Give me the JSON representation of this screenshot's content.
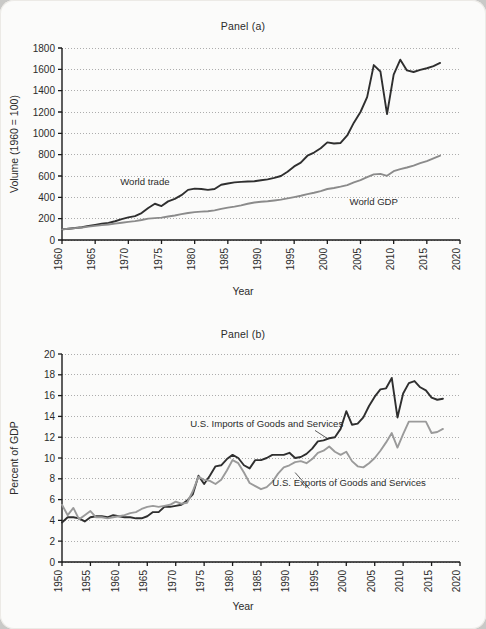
{
  "figure": {
    "background_color": "#fbfbfa",
    "page_color": "#c9c9c7",
    "axis_color": "#1a1a1a",
    "grid_color": "#9a9a9a"
  },
  "panels": [
    {
      "id": "panel-a",
      "title": "Panel (a)",
      "xlabel": "Year",
      "ylabel": "Volume (1960 = 100)",
      "series_colors": {
        "world_trade": "#2f2f2f",
        "world_gdp": "#8b8b8b"
      },
      "annotations": [
        {
          "text": "World trade",
          "x": 1972.5,
          "y": 520
        },
        {
          "text": "World GDP",
          "x": 2007.0,
          "y": 330
        }
      ]
    },
    {
      "id": "panel-b",
      "title": "Panel (b)",
      "xlabel": "Year",
      "ylabel": "Percent of GDP",
      "series_colors": {
        "imports": "#2f2f2f",
        "exports": "#9a9a9a"
      },
      "annotations": [
        {
          "text": "U.S. Imports of Goods and Services",
          "x": 1986.0,
          "y": 13.0
        },
        {
          "text": "U.S. Exports of Goods and Services",
          "x": 2000.5,
          "y": 7.3
        }
      ]
    }
  ],
  "chart_data": [
    {
      "type": "line",
      "title": "Panel (a)",
      "xlabel": "Year",
      "ylabel": "Volume (1960 = 100)",
      "xlim": [
        1960,
        2020
      ],
      "ylim": [
        0,
        1800
      ],
      "xticks": [
        1960,
        1965,
        1970,
        1975,
        1980,
        1985,
        1990,
        1995,
        2000,
        2005,
        2010,
        2015,
        2020
      ],
      "yticks": [
        0,
        200,
        400,
        600,
        800,
        1000,
        1200,
        1400,
        1600,
        1800
      ],
      "grid": "horizontal-dotted",
      "legend": "inline-annotations",
      "x": [
        1960,
        1961,
        1962,
        1963,
        1964,
        1965,
        1966,
        1967,
        1968,
        1969,
        1970,
        1971,
        1972,
        1973,
        1974,
        1975,
        1976,
        1977,
        1978,
        1979,
        1980,
        1981,
        1982,
        1983,
        1984,
        1985,
        1986,
        1987,
        1988,
        1989,
        1990,
        1991,
        1992,
        1993,
        1994,
        1995,
        1996,
        1997,
        1998,
        1999,
        2000,
        2001,
        2002,
        2003,
        2004,
        2005,
        2006,
        2007,
        2008,
        2009,
        2010,
        2011,
        2012,
        2013,
        2014,
        2015,
        2016,
        2017
      ],
      "series": [
        {
          "name": "World trade",
          "color": "#2f2f2f",
          "values": [
            100,
            106,
            112,
            120,
            132,
            142,
            153,
            160,
            176,
            196,
            212,
            224,
            252,
            300,
            340,
            318,
            362,
            385,
            420,
            470,
            482,
            478,
            470,
            478,
            518,
            530,
            540,
            545,
            549,
            551,
            560,
            568,
            582,
            600,
            640,
            690,
            725,
            790,
            820,
            860,
            915,
            905,
            910,
            980,
            1100,
            1200,
            1340,
            1640,
            1580,
            1180,
            1550,
            1690,
            1590,
            1575,
            1595,
            1610,
            1630,
            1660
          ]
        },
        {
          "name": "World GDP",
          "color": "#8b8b8b",
          "values": [
            100,
            105,
            111,
            117,
            125,
            132,
            139,
            145,
            153,
            162,
            170,
            177,
            187,
            200,
            205,
            210,
            220,
            230,
            242,
            253,
            261,
            266,
            270,
            278,
            292,
            303,
            313,
            325,
            340,
            352,
            358,
            363,
            370,
            378,
            390,
            402,
            415,
            430,
            443,
            458,
            478,
            488,
            500,
            515,
            540,
            562,
            590,
            615,
            620,
            602,
            645,
            665,
            680,
            698,
            720,
            740,
            765,
            790
          ]
        }
      ]
    },
    {
      "type": "line",
      "title": "Panel (b)",
      "xlabel": "Year",
      "ylabel": "Percent of GDP",
      "xlim": [
        1950,
        2020
      ],
      "ylim": [
        0,
        20
      ],
      "xticks": [
        1950,
        1955,
        1960,
        1965,
        1970,
        1975,
        1980,
        1985,
        1990,
        1995,
        2000,
        2005,
        2010,
        2015,
        2020
      ],
      "yticks": [
        0,
        2,
        4,
        6,
        8,
        10,
        12,
        14,
        16,
        18,
        20
      ],
      "grid": "horizontal-dotted",
      "legend": "inline-annotations",
      "x": [
        1950,
        1951,
        1952,
        1953,
        1954,
        1955,
        1956,
        1957,
        1958,
        1959,
        1960,
        1961,
        1962,
        1963,
        1964,
        1965,
        1966,
        1967,
        1968,
        1969,
        1970,
        1971,
        1972,
        1973,
        1974,
        1975,
        1976,
        1977,
        1978,
        1979,
        1980,
        1981,
        1982,
        1983,
        1984,
        1985,
        1986,
        1987,
        1988,
        1989,
        1990,
        1991,
        1992,
        1993,
        1994,
        1995,
        1996,
        1997,
        1998,
        1999,
        2000,
        2001,
        2002,
        2003,
        2004,
        2005,
        2006,
        2007,
        2008,
        2009,
        2010,
        2011,
        2012,
        2013,
        2014,
        2015,
        2016,
        2017
      ],
      "series": [
        {
          "name": "U.S. Imports of Goods and Services",
          "color": "#2f2f2f",
          "values": [
            3.8,
            4.3,
            4.3,
            4.2,
            3.9,
            4.3,
            4.4,
            4.4,
            4.3,
            4.5,
            4.4,
            4.3,
            4.3,
            4.2,
            4.2,
            4.4,
            4.8,
            4.8,
            5.3,
            5.3,
            5.4,
            5.5,
            5.9,
            6.5,
            8.3,
            7.5,
            8.3,
            9.2,
            9.3,
            9.9,
            10.3,
            10.0,
            9.3,
            9.0,
            9.8,
            9.8,
            10.0,
            10.3,
            10.3,
            10.3,
            10.5,
            10.0,
            10.1,
            10.4,
            10.9,
            11.6,
            11.7,
            11.9,
            12.0,
            12.8,
            14.5,
            13.2,
            13.3,
            13.9,
            15.0,
            15.9,
            16.6,
            16.7,
            17.7,
            13.9,
            16.2,
            17.2,
            17.4,
            16.8,
            16.5,
            15.8,
            15.6,
            15.7
          ]
        },
        {
          "name": "U.S. Exports of Goods and Services",
          "color": "#9a9a9a",
          "values": [
            5.5,
            4.5,
            5.2,
            4.1,
            4.5,
            4.9,
            4.3,
            4.3,
            4.2,
            4.3,
            4.4,
            4.5,
            4.7,
            4.8,
            5.1,
            5.3,
            5.4,
            5.3,
            5.4,
            5.5,
            5.8,
            5.6,
            5.7,
            6.8,
            8.2,
            7.9,
            7.8,
            7.5,
            7.9,
            8.8,
            9.8,
            9.5,
            8.6,
            7.6,
            7.3,
            7.0,
            7.2,
            7.7,
            8.5,
            9.1,
            9.3,
            9.6,
            9.7,
            9.5,
            9.9,
            10.5,
            10.7,
            11.1,
            10.6,
            10.3,
            10.6,
            9.7,
            9.2,
            9.1,
            9.5,
            10.0,
            10.7,
            11.5,
            12.4,
            11.0,
            12.3,
            13.5,
            13.5,
            13.5,
            13.5,
            12.4,
            12.5,
            12.8
          ]
        }
      ]
    }
  ]
}
